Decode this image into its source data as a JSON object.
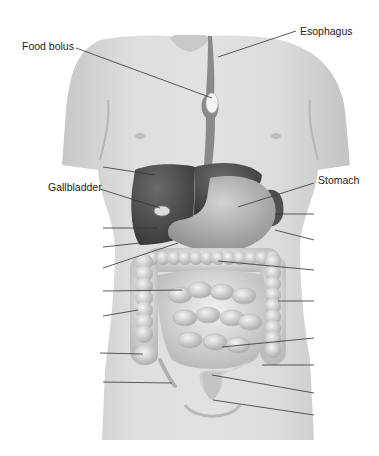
{
  "figure": {
    "labels": {
      "food_bolus": "Food bolus",
      "esophagus": "Esophagus",
      "gallbladder": "Gallbladder",
      "stomach": "Stomach"
    },
    "unlabeled_leader_count": 16,
    "colors": {
      "skin": "#d9d9d9",
      "skin_shadow": "#b8b8b8",
      "liver": "#4a4a4a",
      "stomach": "#b9b9b9",
      "intestine": "#e3e3e3",
      "leader_line": "#333333",
      "text": "#222222"
    }
  }
}
